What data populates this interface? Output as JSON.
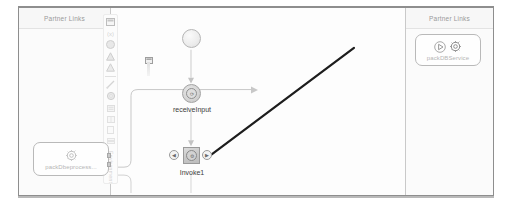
{
  "window": {
    "title": "BPEL Process Designer"
  },
  "lanes": {
    "left": {
      "title": "Partner Links"
    },
    "right": {
      "title": "Partner Links"
    }
  },
  "palette": {
    "vertical_label": "Environment",
    "items": [
      {
        "name": "note-icon",
        "glyph": "▤"
      },
      {
        "name": "variable-icon",
        "glyph": "(x)"
      },
      {
        "name": "circle-icon",
        "glyph": "●"
      },
      {
        "name": "triangle-icon",
        "glyph": "▲"
      },
      {
        "name": "triangle-2-icon",
        "glyph": "▲"
      },
      {
        "name": "connector-icon",
        "glyph": "⟋"
      },
      {
        "name": "gear-icon",
        "glyph": "⚙"
      },
      {
        "name": "list-icon",
        "glyph": "▤"
      },
      {
        "name": "grid-icon",
        "glyph": "▦"
      },
      {
        "name": "doc-icon",
        "glyph": "▢"
      },
      {
        "name": "stack-icon",
        "glyph": "▥"
      }
    ]
  },
  "partner_links": {
    "left": {
      "label": "packDbeprocess...",
      "gear_glyph": "⚙"
    },
    "right": {
      "label": "packDBService",
      "play_glyph": "▷",
      "gear_glyph": "⚙"
    }
  },
  "process": {
    "start": {
      "name": "start-event",
      "label": ""
    },
    "receive": {
      "label": "receiveInput",
      "glyph": "⟳"
    },
    "invoke": {
      "label": "Invoke1",
      "glyph": "⚙",
      "handle_left": "◀",
      "handle_right": "▶"
    }
  },
  "colors": {
    "frame_border": "#8e8e8e",
    "lane_background": "#fbfbfb",
    "lane_title": "#9a9a9a",
    "node_label": "#3c3c3c",
    "plink_label": "#b5b5b5",
    "connector_light": "#c6c6c6",
    "connector_dark": "#1a1a1a",
    "canvas": "#ffffff"
  }
}
